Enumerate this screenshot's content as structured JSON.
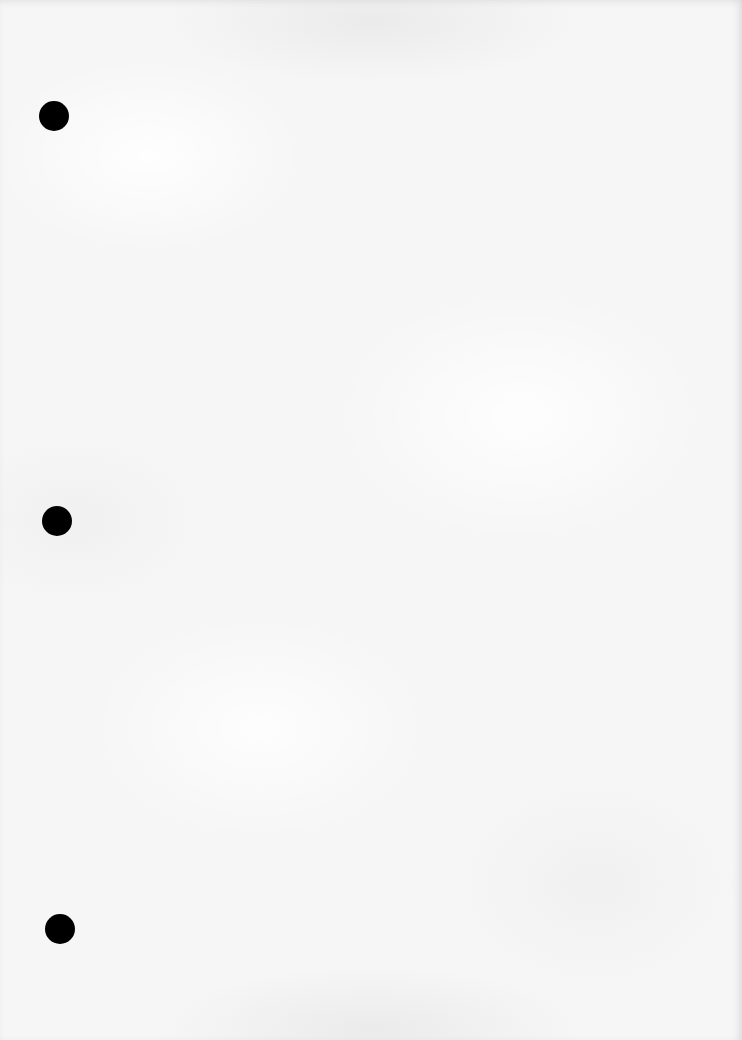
{
  "sheet": {
    "description": "Blank three-hole-punched paper",
    "paper_color": "#f6f6f6",
    "hole_color": "#000000",
    "holes": [
      {
        "name": "top",
        "cx": 54,
        "cy": 116,
        "r": 15
      },
      {
        "name": "middle",
        "cx": 57,
        "cy": 521,
        "r": 15
      },
      {
        "name": "bottom",
        "cx": 60,
        "cy": 929,
        "r": 15
      }
    ]
  }
}
